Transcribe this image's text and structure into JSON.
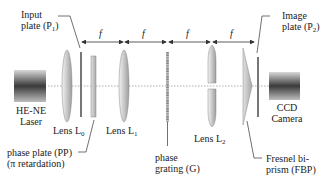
{
  "labels": {
    "input_plate": {
      "line1": "Input",
      "line2": "plate (P",
      "sub": "1",
      "close": ")"
    },
    "image_plate": {
      "line1": "Image",
      "line2": "plate (P",
      "sub": "2",
      "close": ")"
    },
    "laser": {
      "line1": "HE-NE",
      "line2": "Laser"
    },
    "camera": {
      "line1": "CCD",
      "line2": "Camera"
    },
    "lens_l0": {
      "text": "Lens L",
      "sub": "0"
    },
    "lens_l1": {
      "text": "Lens L",
      "sub": "1"
    },
    "lens_l2": {
      "text": "Lens L",
      "sub": "2"
    },
    "phase_plate": {
      "line1": "phase plate (PP)",
      "line2": "(π retardation)"
    },
    "phase_grating": {
      "line1": "phase",
      "line2": "grating (G)"
    },
    "fresnel": {
      "line1": "Fresnel bi-",
      "line2": "prism (FBP)"
    }
  },
  "focal_marks": [
    "f",
    "f",
    "f",
    "f"
  ],
  "colors": {
    "line": "#333333",
    "axis": "#888888",
    "lens_light": "#e8e8e8",
    "lens_dark": "#9a9a9a",
    "device_dark": "#3a3a3a",
    "device_light": "#cfcfcf"
  }
}
